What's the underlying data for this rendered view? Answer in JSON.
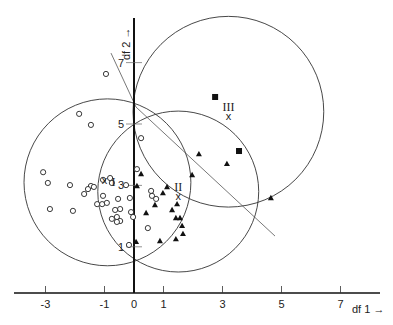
{
  "chart_data": {
    "type": "scatter",
    "title": "",
    "xlabel": "df 1",
    "ylabel": "df 2",
    "xlim": [
      -4.5,
      8.8
    ],
    "ylim": [
      -0.5,
      8.5
    ],
    "x_ticks": [
      -3,
      -1,
      0,
      1,
      3,
      5,
      7
    ],
    "x_tick_labels": [
      "-3",
      "-1",
      "0",
      "1",
      "3",
      "5",
      "7"
    ],
    "y_ticks": [
      1,
      3,
      5,
      7
    ],
    "y_tick_labels": [
      "1",
      "3",
      "5",
      "7"
    ],
    "grid": false,
    "legend": null,
    "series": [
      {
        "name": "Group I",
        "marker": "open-circle",
        "centroid_label": "I",
        "centroid": [
          -0.9,
          3.1
        ],
        "radius": 2.8,
        "points": [
          [
            -0.95,
            6.63
          ],
          [
            -1.86,
            5.33
          ],
          [
            -1.46,
            4.97
          ],
          [
            -3.08,
            3.43
          ],
          [
            -2.92,
            3.08
          ],
          [
            -2.17,
            3.01
          ],
          [
            -1.46,
            2.98
          ],
          [
            -1.56,
            2.88
          ],
          [
            -1.36,
            2.95
          ],
          [
            -1.69,
            2.72
          ],
          [
            -2.85,
            2.23
          ],
          [
            -2.07,
            2.17
          ],
          [
            -1.25,
            2.39
          ],
          [
            -1.08,
            2.39
          ],
          [
            -0.92,
            2.43
          ],
          [
            -1.05,
            3.18
          ],
          [
            -0.81,
            3.24
          ],
          [
            -0.75,
            3.08
          ],
          [
            -0.27,
            3.01
          ],
          [
            -0.54,
            2.56
          ],
          [
            -1.05,
            2.66
          ],
          [
            -0.47,
            2.23
          ],
          [
            -0.64,
            2.2
          ],
          [
            -0.58,
            1.97
          ],
          [
            -0.75,
            1.91
          ],
          [
            -0.47,
            1.84
          ],
          [
            -0.58,
            1.81
          ],
          [
            -0.17,
            1.06
          ],
          [
            -0.1,
            2.13
          ],
          [
            -0.14,
            2.59
          ],
          [
            0.24,
            4.54
          ],
          [
            0.1,
            3.53
          ],
          [
            0.58,
            2.82
          ],
          [
            0.61,
            2.66
          ],
          [
            0.75,
            2.56
          ],
          [
            0.47,
            1.61
          ],
          [
            -0.03,
            1.97
          ]
        ]
      },
      {
        "name": "Group II",
        "marker": "filled-triangle",
        "centroid_label": "II",
        "centroid": [
          1.5,
          2.8
        ],
        "radius": 2.7,
        "points": [
          [
            0.1,
            2.98
          ],
          [
            0.41,
            2.1
          ],
          [
            0.24,
            3.37
          ],
          [
            0.98,
            2.75
          ],
          [
            1.12,
            2.95
          ],
          [
            1.29,
            2.2
          ],
          [
            1.46,
            2.39
          ],
          [
            1.56,
            1.94
          ],
          [
            1.63,
            1.68
          ],
          [
            1.42,
            1.94
          ],
          [
            1.66,
            1.42
          ],
          [
            1.42,
            1.25
          ],
          [
            0.88,
            1.19
          ],
          [
            0.71,
            2.36
          ],
          [
            2.2,
            4.02
          ],
          [
            3.15,
            3.7
          ],
          [
            4.64,
            2.59
          ],
          [
            1.97,
            3.34
          ],
          [
            0.07,
            1.16
          ]
        ]
      },
      {
        "name": "Group III",
        "marker": "filled-square",
        "centroid_label": "III",
        "centroid": [
          3.2,
          5.4
        ],
        "radius": 3.2,
        "points": [
          [
            2.75,
            5.88
          ],
          [
            3.56,
            4.12
          ]
        ]
      }
    ],
    "boundary_lines": [
      {
        "from": [
          -0.78,
          7.31
        ],
        "to": [
          0.07,
          5.55
        ]
      },
      {
        "from": [
          0.07,
          5.55
        ],
        "to": [
          4.78,
          1.35
        ]
      }
    ],
    "annotations": [
      {
        "text": "I",
        "at": [
          -0.9,
          3.1
        ],
        "marker": "x"
      },
      {
        "text": "II",
        "at": [
          1.5,
          2.8
        ],
        "marker": "x"
      },
      {
        "text": "III",
        "at": [
          3.2,
          5.4
        ],
        "marker": "x"
      }
    ]
  },
  "axes": {
    "x_label": "df 1",
    "y_label": "df 2",
    "arrow": "→"
  }
}
